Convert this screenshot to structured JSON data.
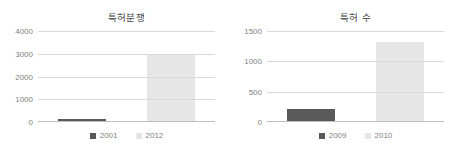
{
  "page": {
    "background": "#ffffff",
    "width": 458,
    "height": 152
  },
  "palette": {
    "series_dark": "#595959",
    "series_light": "#e6e6e6",
    "gridline": "#d9d9d9",
    "axis": "#bfbfbf",
    "tick_text": "#7f7f7f",
    "title_text": "#3f3f3f"
  },
  "charts": [
    {
      "id": "patent-disputes",
      "title": "특허분쟁",
      "legend": [
        {
          "label": "2001",
          "color": "#595959"
        },
        {
          "label": "2012",
          "color": "#e6e6e6"
        }
      ],
      "yticks": [
        "0",
        "1000",
        "2000",
        "3000",
        "4000"
      ]
    },
    {
      "id": "patent-count",
      "title": "특허 수",
      "legend": [
        {
          "label": "2009",
          "color": "#595959"
        },
        {
          "label": "2010",
          "color": "#e6e6e6"
        }
      ],
      "yticks": [
        "0",
        "500",
        "1000",
        "1500"
      ]
    }
  ],
  "chart_data": [
    {
      "type": "bar",
      "title": "특허분쟁",
      "xlabel": "",
      "ylabel": "",
      "categories": [
        "2001",
        "2012"
      ],
      "values": [
        100,
        2900
      ],
      "series": [
        {
          "name": "2001",
          "values": [
            100
          ],
          "color": "#595959"
        },
        {
          "name": "2012",
          "values": [
            2900
          ],
          "color": "#e6e6e6"
        }
      ],
      "ylim": [
        0,
        4000
      ],
      "yticks": [
        0,
        1000,
        2000,
        3000,
        4000
      ],
      "grid": true,
      "legend_position": "bottom"
    },
    {
      "type": "bar",
      "title": "특허 수",
      "xlabel": "",
      "ylabel": "",
      "categories": [
        "2009",
        "2010"
      ],
      "values": [
        200,
        1310
      ],
      "series": [
        {
          "name": "2009",
          "values": [
            200
          ],
          "color": "#595959"
        },
        {
          "name": "2010",
          "values": [
            1310
          ],
          "color": "#e6e6e6"
        }
      ],
      "ylim": [
        0,
        1500
      ],
      "yticks": [
        0,
        500,
        1000,
        1500
      ],
      "grid": true,
      "legend_position": "bottom"
    }
  ]
}
